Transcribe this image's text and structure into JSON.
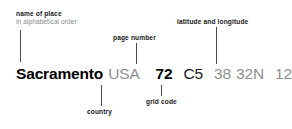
{
  "diagram": {
    "background_color": "#ffffff",
    "line_color": "#4a4a4a",
    "label_color": "#1a1a1a",
    "muted_color": "#8e8e8e"
  },
  "entry": {
    "place": "Sacramento",
    "country": "USA",
    "page": "72",
    "grid": "C5",
    "lat_value": "38",
    "lat_dir": "32N",
    "lon_value": "121",
    "lon_dir": "30W"
  },
  "callouts": {
    "name_of_place": {
      "main": "name of place",
      "sub": "in alphabetical order"
    },
    "page_number": {
      "main": "page number"
    },
    "latitude_longitude": {
      "main": "latitude and longitude"
    },
    "country": {
      "main": "country"
    },
    "grid_code": {
      "main": "grid code"
    }
  }
}
